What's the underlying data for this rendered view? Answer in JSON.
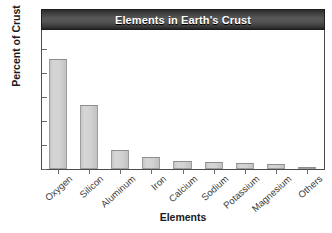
{
  "figure": {
    "top_partial_text": "",
    "title": "Elements in Earth's Crust",
    "x_axis_title": "Elements",
    "y_axis_title": "Percent of Crust"
  },
  "chart_data": {
    "type": "bar",
    "title": "Elements in Earth's Crust",
    "xlabel": "Elements",
    "ylabel": "Percent of Crust",
    "categories": [
      "Oxygen",
      "Silicon",
      "Aluminum",
      "Iron",
      "Calcium",
      "Sodium",
      "Potassium",
      "Magnesium",
      "Others"
    ],
    "values": [
      46,
      27,
      8,
      5,
      3.5,
      2.8,
      2.6,
      2.1,
      1
    ],
    "ylim": [
      0,
      58
    ],
    "yticks": [
      0,
      10,
      20,
      30,
      40,
      50
    ],
    "ytick_labels": [
      "0",
      "10",
      "20",
      "30",
      "40",
      "50"
    ],
    "grid": false,
    "legend": false,
    "bar_color": "#d0d0d0",
    "bar_edge_color": "#9d9d9d",
    "title_bar_color": "#4a4a4a",
    "title_text_color": "#ffffff"
  }
}
